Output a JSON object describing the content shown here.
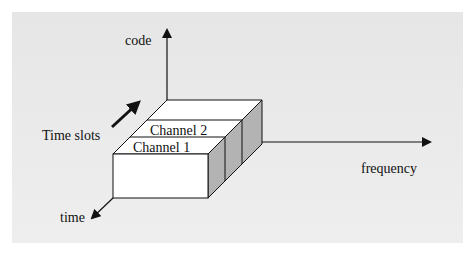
{
  "diagram": {
    "type": "3d-axes-block",
    "axes": {
      "vertical": {
        "label": "code"
      },
      "horizontal": {
        "label": "frequency"
      },
      "depth": {
        "label": "time"
      }
    },
    "annotation": {
      "label": "Time slots"
    },
    "channels": [
      {
        "label": "Channel 1"
      },
      {
        "label": "Channel 2"
      }
    ],
    "colors": {
      "background": "#e8e8e8",
      "face": "#ffffff",
      "side": "#b3b3b3",
      "stroke": "#111111"
    }
  }
}
